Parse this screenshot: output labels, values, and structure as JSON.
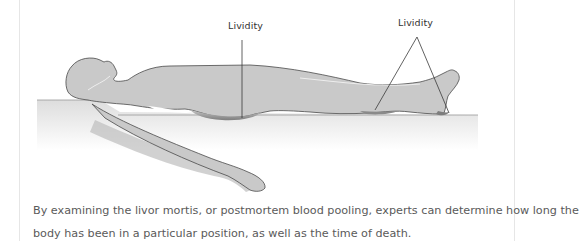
{
  "figure": {
    "labels": [
      {
        "text": "Lividity",
        "target": "lower back / buttocks"
      },
      {
        "text": "Lividity",
        "target": "calves and heels"
      }
    ],
    "colors": {
      "body_fill": "#c9c9c9",
      "body_outline": "#4a4a4a",
      "lividity_fill": "#8d8d8d",
      "table_top": "#d6d6d6",
      "leader_line": "#3a3a3a",
      "label_text": "#333333"
    }
  },
  "caption": {
    "line1": "By examining the livor mortis, or postmortem blood pooling, experts can determine how long the",
    "line2": "body has been in a particular position, as well as the time of death."
  }
}
